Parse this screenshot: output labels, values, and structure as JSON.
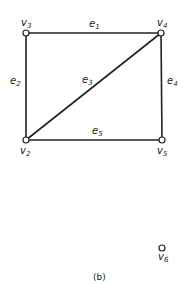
{
  "diagram": {
    "type": "graph",
    "caption": "(b)",
    "vertices": [
      {
        "id": "v2",
        "base": "v",
        "sub": "2",
        "x": 26,
        "y": 140
      },
      {
        "id": "v3",
        "base": "v",
        "sub": "3",
        "x": 26,
        "y": 33
      },
      {
        "id": "v4",
        "base": "v",
        "sub": "4",
        "x": 161,
        "y": 33
      },
      {
        "id": "v5",
        "base": "v",
        "sub": "5",
        "x": 162,
        "y": 140
      },
      {
        "id": "v6",
        "base": "v",
        "sub": "6",
        "x": 162,
        "y": 248
      }
    ],
    "edges": [
      {
        "id": "e1",
        "base": "e",
        "sub": "1",
        "from": "v3",
        "to": "v4"
      },
      {
        "id": "e2",
        "base": "e",
        "sub": "2",
        "from": "v3",
        "to": "v2"
      },
      {
        "id": "e3",
        "base": "e",
        "sub": "3",
        "from": "v2",
        "to": "v4"
      },
      {
        "id": "e4",
        "base": "e",
        "sub": "4",
        "from": "v4",
        "to": "v5"
      },
      {
        "id": "e5",
        "base": "e",
        "sub": "5",
        "from": "v2",
        "to": "v5"
      }
    ]
  }
}
